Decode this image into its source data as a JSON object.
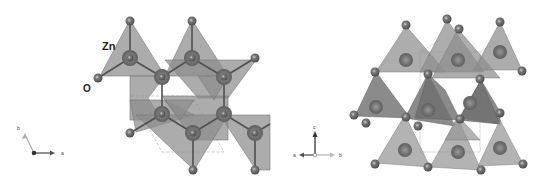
{
  "figure": {
    "left_panel": {
      "view": "top view (c-axis projection)",
      "labels": {
        "zn": "Zn",
        "o": "O"
      },
      "axes": {
        "a": "a",
        "b": "b"
      }
    },
    "right_panel": {
      "view": "side view",
      "axes": {
        "a": "a",
        "b": "b",
        "c": "c"
      }
    }
  },
  "colors": {
    "tetrahedron": "#8a8a8a",
    "tetrahedron_dark": "#6a6a6a",
    "o_atom": "#6e6e6e",
    "zn_atom": "#7d7d7d",
    "bond": "#555555",
    "cell": "#b0b0b0"
  }
}
